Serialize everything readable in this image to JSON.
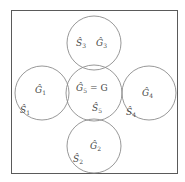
{
  "figure": {
    "type": "set-diagram",
    "background_color": "#ffffff",
    "frame_color": "#5a5a5a",
    "circle_color": "#8c8c8c",
    "text_color": "#4a4a4a"
  },
  "frame": {
    "label": "outer-universe-rectangle",
    "x": 11,
    "y": 10,
    "width": 167,
    "height": 164
  },
  "circles": [
    {
      "id": "top",
      "cx": 94,
      "cy": 43,
      "r": 27,
      "labels": [
        {
          "base": "S",
          "hat": "̂",
          "sub": "3",
          "x": 80,
          "y": 46
        },
        {
          "base": "G",
          "hat": "̂",
          "sub": "3",
          "x": 100,
          "y": 46
        }
      ]
    },
    {
      "id": "left",
      "cx": 42,
      "cy": 93,
      "r": 27,
      "labels": [
        {
          "base": "G",
          "hat": "̂",
          "sub": "1",
          "x": 38,
          "y": 92
        },
        {
          "base": "S",
          "hat": "̂",
          "sub": "1",
          "x": 23,
          "y": 112
        }
      ]
    },
    {
      "id": "center",
      "cx": 94,
      "cy": 93,
      "r": 28,
      "labels": [
        {
          "base": "G",
          "hat": "̂",
          "sub": "5",
          "eq": "= G",
          "x": 78,
          "y": 90
        },
        {
          "base": "S",
          "hat": "̂",
          "sub": "5",
          "x": 96,
          "y": 110
        }
      ]
    },
    {
      "id": "right",
      "cx": 149,
      "cy": 93,
      "r": 27,
      "labels": [
        {
          "base": "G",
          "hat": "̂",
          "sub": "4",
          "x": 146,
          "y": 95
        },
        {
          "base": "S",
          "hat": "̂",
          "sub": "4",
          "x": 129,
          "y": 114
        }
      ]
    },
    {
      "id": "bottom",
      "cx": 94,
      "cy": 146,
      "r": 27,
      "labels": [
        {
          "base": "G",
          "hat": "̂",
          "sub": "2",
          "x": 94,
          "y": 148
        },
        {
          "base": "S",
          "hat": "̂",
          "sub": "2",
          "x": 76,
          "y": 160
        }
      ]
    }
  ],
  "text_items": {
    "S3": "Ŝ",
    "G3": "Ĝ",
    "G1": "Ĝ",
    "S1": "Ŝ",
    "G5": "Ĝ",
    "S5": "Ŝ",
    "G4": "Ĝ",
    "S4": "Ŝ",
    "G2": "Ĝ",
    "S2": "Ŝ",
    "equals_G": "= G",
    "sub_1": "1",
    "sub_2": "2",
    "sub_3": "3",
    "sub_4": "4",
    "sub_5": "5"
  }
}
